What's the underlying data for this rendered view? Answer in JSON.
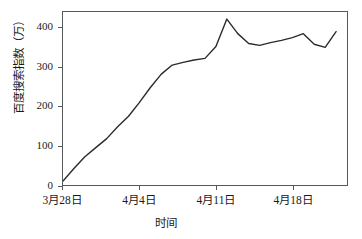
{
  "chart_data": {
    "type": "line",
    "title": "",
    "xlabel": "时间",
    "ylabel": "百度搜索指数（万）",
    "ylim": [
      0,
      440
    ],
    "xlim": [
      0,
      26
    ],
    "grid": false,
    "legend": null,
    "y_ticks": [
      {
        "value": 0,
        "label": "0"
      },
      {
        "value": 100,
        "label": "100"
      },
      {
        "value": 200,
        "label": "200"
      },
      {
        "value": 300,
        "label": "300"
      },
      {
        "value": 400,
        "label": "400"
      }
    ],
    "x_ticks": [
      {
        "value": 0,
        "label": "3月28日"
      },
      {
        "value": 7,
        "label": "4月4日"
      },
      {
        "value": 14,
        "label": "4月11日"
      },
      {
        "value": 21,
        "label": "4月18日"
      }
    ],
    "x": [
      0,
      1,
      2,
      3,
      4,
      5,
      6,
      7,
      8,
      9,
      10,
      11,
      12,
      13,
      14,
      15,
      16,
      17,
      18,
      19,
      20,
      21,
      22,
      23,
      24,
      25
    ],
    "values": [
      10,
      42,
      72,
      95,
      118,
      148,
      175,
      210,
      248,
      282,
      305,
      312,
      318,
      322,
      352,
      422,
      385,
      360,
      355,
      362,
      368,
      375,
      385,
      358,
      350,
      390
    ],
    "series": [
      {
        "name": "百度搜索指数",
        "color": "#2b2b2b",
        "values": [
          10,
          42,
          72,
          95,
          118,
          148,
          175,
          210,
          248,
          282,
          305,
          312,
          318,
          322,
          352,
          422,
          385,
          360,
          355,
          362,
          368,
          375,
          385,
          358,
          350,
          390
        ]
      }
    ],
    "line_color": "#2b2b2b",
    "line_width": 1.4,
    "axis_color": "#55595c"
  }
}
